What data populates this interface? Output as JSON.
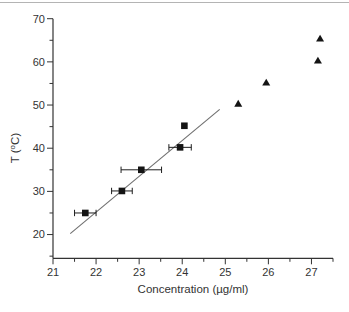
{
  "figure": {
    "background": "#ffffff",
    "edge_line_color": "#b4b4b4"
  },
  "chart_data": {
    "type": "scatter",
    "title": "",
    "xlabel": "Concentration (µg/ml)",
    "ylabel": "T (°C)",
    "ylabel_parts": {
      "pre": "T (",
      "sup": "o",
      "post": "C)"
    },
    "xlim": [
      21,
      27.5
    ],
    "ylim": [
      14.5,
      70
    ],
    "x_major_ticks": [
      21,
      22,
      23,
      24,
      25,
      26,
      27
    ],
    "x_tick_labels": [
      "21",
      "22",
      "23",
      "24",
      "25",
      "26",
      "27"
    ],
    "x_minor_step": 0.5,
    "y_major_ticks": [
      20,
      30,
      40,
      50,
      60,
      70
    ],
    "y_tick_labels": [
      "20",
      "30",
      "40",
      "50",
      "60",
      "70"
    ],
    "y_minor_step": 5,
    "grid": false,
    "legend_position": "none",
    "axis_color": "#333333",
    "series": [
      {
        "name": "squares-with-x-error",
        "marker": "square",
        "color": "#141414",
        "error_bar_color": "#1e1e1e",
        "points": [
          {
            "x": 21.75,
            "y": 25.0,
            "xerr": 0.25
          },
          {
            "x": 22.6,
            "y": 30.1,
            "xerr": 0.24
          },
          {
            "x": 23.05,
            "y": 35.0,
            "xerr": 0.47
          },
          {
            "x": 23.95,
            "y": 40.2,
            "xerr": 0.26
          },
          {
            "x": 24.05,
            "y": 45.2,
            "xerr": 0
          }
        ]
      },
      {
        "name": "triangles",
        "marker": "triangle",
        "color": "#141414",
        "points": [
          {
            "x": 25.3,
            "y": 50.3
          },
          {
            "x": 25.95,
            "y": 55.2
          },
          {
            "x": 27.15,
            "y": 60.3
          },
          {
            "x": 27.2,
            "y": 65.4
          }
        ]
      }
    ],
    "fit_line": {
      "x1": 21.4,
      "y1": 20.2,
      "x2": 24.87,
      "y2": 49.0,
      "color": "#6f6f6f"
    }
  }
}
